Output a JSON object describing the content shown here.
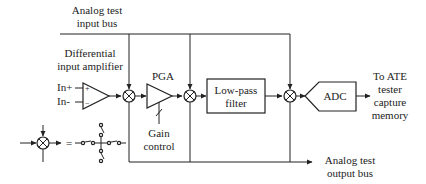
{
  "diagram": {
    "labels": {
      "input_bus_line1": "Analog test",
      "input_bus_line2": "input bus",
      "diff_amp_line1": "Differential",
      "diff_amp_line2": "input amplifier",
      "in_plus": "In+",
      "in_minus": "In-",
      "plus_sign": "+",
      "minus_sign": "−",
      "pga": "PGA",
      "gain_line1": "Gain",
      "gain_line2": "control",
      "lpf_line1": "Low-pass",
      "lpf_line2": "filter",
      "adc": "ADC",
      "ate_line1": "To ATE",
      "ate_line2": "tester",
      "ate_line3": "capture",
      "ate_line4": "memory",
      "output_bus_line1": "Analog test",
      "output_bus_line2": "output bus",
      "equals": "="
    },
    "blocks": [
      {
        "id": "diff-amp",
        "type": "amplifier"
      },
      {
        "id": "mux1",
        "type": "analog-switch-node"
      },
      {
        "id": "pga",
        "type": "amplifier"
      },
      {
        "id": "mux2",
        "type": "analog-switch-node"
      },
      {
        "id": "lpf",
        "type": "box"
      },
      {
        "id": "mux3",
        "type": "analog-switch-node"
      },
      {
        "id": "adc",
        "type": "converter"
      }
    ],
    "colors": {
      "line": "#222222",
      "background": "#ffffff"
    }
  }
}
